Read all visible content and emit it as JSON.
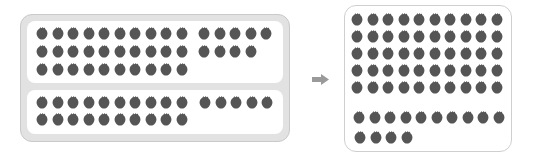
{
  "diagram": {
    "left": {
      "top_panel": {
        "rows_of_ten": 3,
        "extra_rows": [
          5,
          4
        ],
        "total": 39
      },
      "bottom_panel": {
        "rows_of_ten": 2,
        "extra_rows": [
          5
        ],
        "total": 25
      }
    },
    "arrow": "right-arrow-icon",
    "right": {
      "rows_of_ten": 6,
      "extra_rows": [
        4
      ],
      "total": 64
    },
    "colors": {
      "berry": "#555555",
      "outer_frame": "#e2e2e2",
      "border": "#c9c9c9",
      "arrow": "#9a9a9a"
    }
  }
}
